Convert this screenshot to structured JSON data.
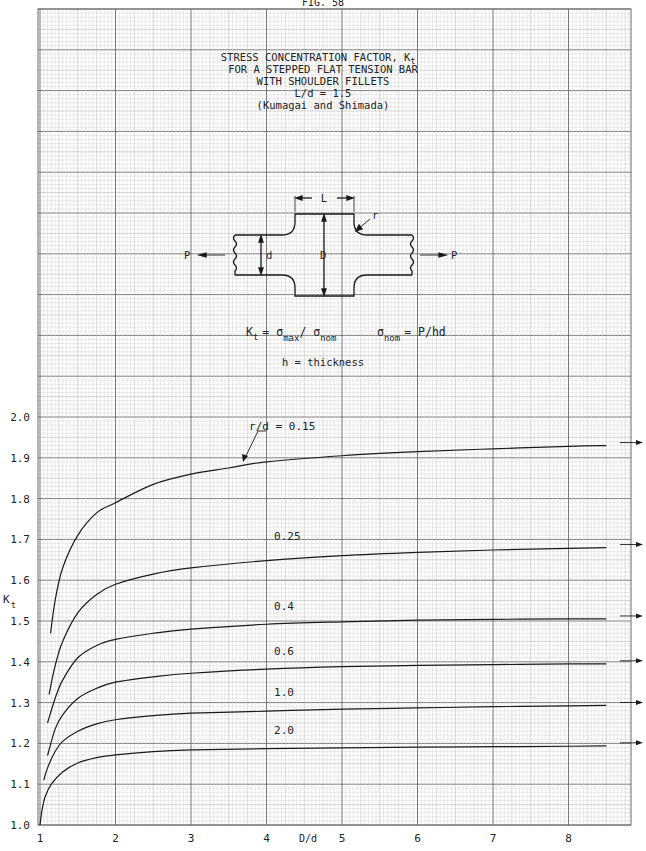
{
  "header": {
    "figure_label": "FIG. 58"
  },
  "title": {
    "line1": "STRESS CONCENTRATION FACTOR, K",
    "line1_sub": "t",
    "line2": "FOR A STEPPED FLAT TENSION BAR",
    "line3": "WITH SHOULDER FILLETS",
    "line4": "L/d = 1.5",
    "line5": "(Kumagai and Shimada)"
  },
  "diagram": {
    "labels": {
      "L": "L",
      "r": "r",
      "d": "d",
      "D": "D",
      "P_left": "P",
      "P_right": "P"
    }
  },
  "formula": {
    "kt": "K",
    "kt_sub": "t",
    "eq": "= σ",
    "max_sub": "max",
    "slash": "/ σ",
    "nom_sub": "nom",
    "sigma_nom": "σ",
    "sigma_nom_sub": "nom",
    "sigma_nom_eq": "= P/hd",
    "thickness": "h = thickness"
  },
  "colors": {
    "grid_minor": "#d4d4d4",
    "grid_mid": "#a8a8a8",
    "grid_major": "#6a6a6a",
    "curve": "#1a1a1a"
  },
  "chart_data": {
    "type": "line",
    "xlabel": "D/d",
    "ylabel": "Kt",
    "xlim": [
      1,
      8.5
    ],
    "ylim": [
      1.0,
      2.0
    ],
    "xticks": [
      1,
      2,
      3,
      4,
      5,
      6,
      7,
      8
    ],
    "yticks": [
      1.0,
      1.1,
      1.2,
      1.3,
      1.4,
      1.5,
      1.6,
      1.7,
      1.8,
      1.9,
      2.0
    ],
    "ytick_labels": [
      "1.0",
      "1.1",
      "1.2",
      "1.3",
      "1.4",
      "1.5",
      "1.6",
      "1.7",
      "1.8",
      "1.9",
      "2.0"
    ],
    "grid": true,
    "legend_position": "inline labels",
    "series": [
      {
        "name": "r/d = 0.15",
        "label": "r/d = 0.15",
        "x": [
          1.14,
          1.2,
          1.3,
          1.5,
          1.75,
          2.0,
          2.5,
          3.0,
          3.5,
          4.0,
          5.0,
          6.0,
          7.0,
          8.0,
          8.5
        ],
        "y": [
          1.47,
          1.55,
          1.63,
          1.71,
          1.765,
          1.79,
          1.835,
          1.86,
          1.875,
          1.89,
          1.905,
          1.915,
          1.922,
          1.928,
          1.93
        ]
      },
      {
        "name": "r/d = 0.25",
        "label": "0.25",
        "x": [
          1.12,
          1.2,
          1.3,
          1.5,
          1.75,
          2.0,
          2.5,
          3.0,
          4.0,
          5.0,
          6.0,
          7.0,
          8.0,
          8.5
        ],
        "y": [
          1.32,
          1.39,
          1.45,
          1.52,
          1.565,
          1.59,
          1.615,
          1.63,
          1.648,
          1.66,
          1.668,
          1.674,
          1.678,
          1.68
        ]
      },
      {
        "name": "r/d = 0.4",
        "label": "0.4",
        "x": [
          1.1,
          1.2,
          1.3,
          1.5,
          1.75,
          2.0,
          2.5,
          3.0,
          4.0,
          5.0,
          6.0,
          7.0,
          8.0,
          8.5
        ],
        "y": [
          1.25,
          1.31,
          1.355,
          1.41,
          1.44,
          1.455,
          1.47,
          1.48,
          1.492,
          1.498,
          1.502,
          1.504,
          1.505,
          1.505
        ]
      },
      {
        "name": "r/d = 0.6",
        "label": "0.6",
        "x": [
          1.1,
          1.2,
          1.3,
          1.5,
          1.75,
          2.0,
          2.5,
          3.0,
          4.0,
          5.0,
          6.0,
          7.0,
          8.0,
          8.5
        ],
        "y": [
          1.17,
          1.235,
          1.27,
          1.31,
          1.335,
          1.35,
          1.363,
          1.372,
          1.382,
          1.388,
          1.391,
          1.393,
          1.395,
          1.395
        ]
      },
      {
        "name": "r/d = 1.0",
        "label": "1.0",
        "x": [
          1.05,
          1.1,
          1.2,
          1.3,
          1.5,
          1.75,
          2.0,
          2.5,
          3.0,
          4.0,
          5.0,
          6.0,
          7.0,
          8.0,
          8.5
        ],
        "y": [
          1.11,
          1.14,
          1.18,
          1.205,
          1.23,
          1.248,
          1.258,
          1.268,
          1.274,
          1.279,
          1.284,
          1.287,
          1.29,
          1.292,
          1.293
        ]
      },
      {
        "name": "r/d = 2.0",
        "label": "2.0",
        "x": [
          1.0,
          1.03,
          1.07,
          1.15,
          1.3,
          1.5,
          1.75,
          2.0,
          2.5,
          3.0,
          4.0,
          5.0,
          6.0,
          7.0,
          8.0,
          8.5
        ],
        "y": [
          1.0,
          1.04,
          1.07,
          1.1,
          1.13,
          1.152,
          1.165,
          1.172,
          1.18,
          1.184,
          1.187,
          1.189,
          1.191,
          1.192,
          1.193,
          1.194
        ]
      }
    ],
    "label_positions": [
      {
        "x": 4.1,
        "y": 1.96
      },
      {
        "x": 4.1,
        "y": 1.69
      },
      {
        "x": 4.1,
        "y": 1.52
      },
      {
        "x": 4.1,
        "y": 1.41
      },
      {
        "x": 4.1,
        "y": 1.31
      },
      {
        "x": 4.1,
        "y": 1.215
      }
    ]
  }
}
